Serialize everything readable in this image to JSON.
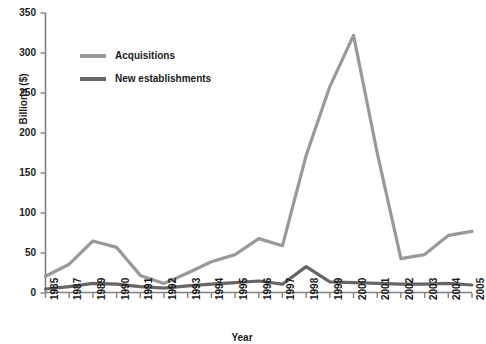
{
  "chart_data": {
    "type": "line",
    "title": "",
    "xlabel": "Year",
    "ylabel": "Billions ($)",
    "categories": [
      "1985",
      "1987",
      "1989",
      "1990",
      "1991",
      "1992",
      "1993",
      "1994",
      "1995",
      "1996",
      "1997",
      "1998",
      "1999",
      "2000",
      "2001",
      "2002",
      "2003",
      "2004",
      "2005"
    ],
    "ylim": [
      0,
      350
    ],
    "yticks": [
      0,
      50,
      100,
      150,
      200,
      250,
      300,
      350
    ],
    "grid": false,
    "legend_position": "top-left",
    "series": [
      {
        "name": "Acquisitions",
        "color": "#999999",
        "values": [
          21,
          36,
          65,
          57,
          22,
          12,
          25,
          39,
          48,
          68,
          59,
          172,
          258,
          322,
          175,
          43,
          48,
          72,
          77
        ]
      },
      {
        "name": "New establishments",
        "color": "#666666",
        "values": [
          5,
          8,
          12,
          11,
          8,
          6,
          9,
          11,
          13,
          15,
          11,
          33,
          14,
          13,
          12,
          11,
          11,
          12,
          10
        ]
      }
    ]
  },
  "axes": {
    "ylabel": "Billions ($)",
    "xlabel": "Year"
  },
  "legend": {
    "items": [
      {
        "label": "Acquisitions",
        "color": "#999999"
      },
      {
        "label": "New establishments",
        "color": "#666666"
      }
    ]
  }
}
